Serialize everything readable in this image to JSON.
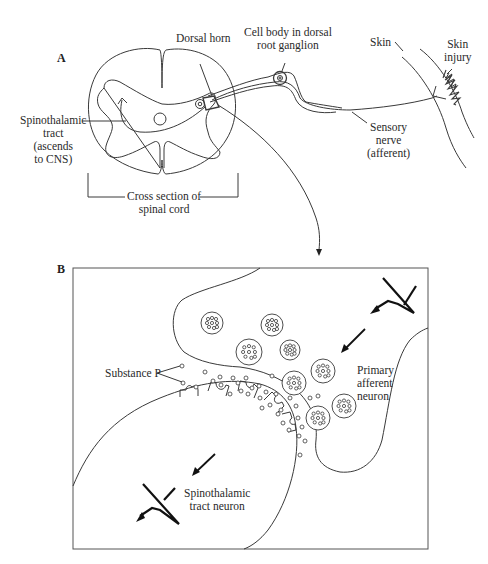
{
  "figure": {
    "panel_a": {
      "letter": "A",
      "labels": {
        "dorsal_horn": "Dorsal horn",
        "cell_body_line1": "Cell body in dorsal",
        "cell_body_line2": "root ganglion",
        "skin": "Skin",
        "skin_injury_line1": "Skin",
        "skin_injury_line2": "injury",
        "spinothalamic_line1": "Spinothalamic",
        "spinothalamic_line2": "tract",
        "spinothalamic_line3": "(ascends",
        "spinothalamic_line4": "to CNS)",
        "sensory_line1": "Sensory",
        "sensory_line2": "nerve",
        "sensory_line3": "(afferent)",
        "cross_section_line1": "Cross section of",
        "cross_section_line2": "spinal cord"
      }
    },
    "panel_b": {
      "letter": "B",
      "labels": {
        "substance_p": "Substance P",
        "primary_line1": "Primary",
        "primary_line2": "afferent",
        "primary_line3": "neuron",
        "spino_line1": "Spinothalamic",
        "spino_line2": "tract neuron"
      }
    },
    "icons": [
      "action-potential-icon",
      "arrow-icon",
      "vesicle-icon",
      "receptor-icon"
    ]
  }
}
